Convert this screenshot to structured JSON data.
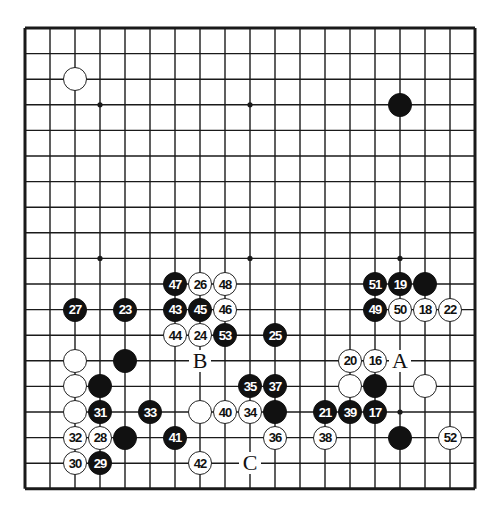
{
  "board": {
    "size": 19,
    "origin_x": 25,
    "origin_y": 28,
    "spacing_x": 25.0,
    "spacing_y": 25.6,
    "line_color": "#1a1a1a",
    "star_points": [
      [
        3,
        3
      ],
      [
        9,
        3
      ],
      [
        15,
        3
      ],
      [
        3,
        9
      ],
      [
        9,
        9
      ],
      [
        15,
        9
      ],
      [
        3,
        15
      ],
      [
        9,
        15
      ],
      [
        15,
        15
      ]
    ]
  },
  "stones": [
    {
      "col": 2,
      "row": 2,
      "color": "white",
      "num": ""
    },
    {
      "col": 15,
      "row": 3,
      "color": "black",
      "num": ""
    },
    {
      "col": 6,
      "row": 10,
      "color": "black",
      "num": "47"
    },
    {
      "col": 7,
      "row": 10,
      "color": "white",
      "num": "26"
    },
    {
      "col": 8,
      "row": 10,
      "color": "white",
      "num": "48"
    },
    {
      "col": 14,
      "row": 10,
      "color": "black",
      "num": "51"
    },
    {
      "col": 15,
      "row": 10,
      "color": "black",
      "num": "19"
    },
    {
      "col": 16,
      "row": 10,
      "color": "black",
      "num": ""
    },
    {
      "col": 2,
      "row": 11,
      "color": "black",
      "num": "27"
    },
    {
      "col": 4,
      "row": 11,
      "color": "black",
      "num": "23"
    },
    {
      "col": 6,
      "row": 11,
      "color": "black",
      "num": "43"
    },
    {
      "col": 7,
      "row": 11,
      "color": "black",
      "num": "45"
    },
    {
      "col": 8,
      "row": 11,
      "color": "white",
      "num": "46"
    },
    {
      "col": 14,
      "row": 11,
      "color": "black",
      "num": "49"
    },
    {
      "col": 15,
      "row": 11,
      "color": "white",
      "num": "50"
    },
    {
      "col": 16,
      "row": 11,
      "color": "white",
      "num": "18"
    },
    {
      "col": 17,
      "row": 11,
      "color": "white",
      "num": "22"
    },
    {
      "col": 6,
      "row": 12,
      "color": "white",
      "num": "44"
    },
    {
      "col": 7,
      "row": 12,
      "color": "white",
      "num": "24"
    },
    {
      "col": 8,
      "row": 12,
      "color": "black",
      "num": "53"
    },
    {
      "col": 10,
      "row": 12,
      "color": "black",
      "num": "25"
    },
    {
      "col": 2,
      "row": 13,
      "color": "white",
      "num": ""
    },
    {
      "col": 4,
      "row": 13,
      "color": "black",
      "num": ""
    },
    {
      "col": 13,
      "row": 13,
      "color": "white",
      "num": "20"
    },
    {
      "col": 14,
      "row": 13,
      "color": "white",
      "num": "16"
    },
    {
      "col": 2,
      "row": 14,
      "color": "white",
      "num": ""
    },
    {
      "col": 3,
      "row": 14,
      "color": "black",
      "num": ""
    },
    {
      "col": 9,
      "row": 14,
      "color": "black",
      "num": "35"
    },
    {
      "col": 10,
      "row": 14,
      "color": "black",
      "num": "37"
    },
    {
      "col": 13,
      "row": 14,
      "color": "white",
      "num": ""
    },
    {
      "col": 14,
      "row": 14,
      "color": "black",
      "num": ""
    },
    {
      "col": 16,
      "row": 14,
      "color": "white",
      "num": ""
    },
    {
      "col": 2,
      "row": 15,
      "color": "white",
      "num": ""
    },
    {
      "col": 3,
      "row": 15,
      "color": "black",
      "num": "31"
    },
    {
      "col": 5,
      "row": 15,
      "color": "black",
      "num": "33"
    },
    {
      "col": 7,
      "row": 15,
      "color": "white",
      "num": ""
    },
    {
      "col": 8,
      "row": 15,
      "color": "white",
      "num": "40"
    },
    {
      "col": 9,
      "row": 15,
      "color": "white",
      "num": "34"
    },
    {
      "col": 10,
      "row": 15,
      "color": "black",
      "num": ""
    },
    {
      "col": 12,
      "row": 15,
      "color": "black",
      "num": "21"
    },
    {
      "col": 13,
      "row": 15,
      "color": "black",
      "num": "39"
    },
    {
      "col": 14,
      "row": 15,
      "color": "black",
      "num": "17"
    },
    {
      "col": 2,
      "row": 16,
      "color": "white",
      "num": "32"
    },
    {
      "col": 3,
      "row": 16,
      "color": "white",
      "num": "28"
    },
    {
      "col": 4,
      "row": 16,
      "color": "black",
      "num": ""
    },
    {
      "col": 6,
      "row": 16,
      "color": "black",
      "num": "41"
    },
    {
      "col": 10,
      "row": 16,
      "color": "white",
      "num": "36"
    },
    {
      "col": 12,
      "row": 16,
      "color": "white",
      "num": "38"
    },
    {
      "col": 15,
      "row": 16,
      "color": "black",
      "num": ""
    },
    {
      "col": 17,
      "row": 16,
      "color": "white",
      "num": "52"
    },
    {
      "col": 2,
      "row": 17,
      "color": "white",
      "num": "30"
    },
    {
      "col": 3,
      "row": 17,
      "color": "black",
      "num": "29"
    },
    {
      "col": 7,
      "row": 17,
      "color": "white",
      "num": "42"
    }
  ],
  "labels": [
    {
      "col": 7,
      "row": 13,
      "text": "B"
    },
    {
      "col": 15,
      "row": 13,
      "text": "A"
    },
    {
      "col": 9,
      "row": 17,
      "text": "C"
    }
  ]
}
